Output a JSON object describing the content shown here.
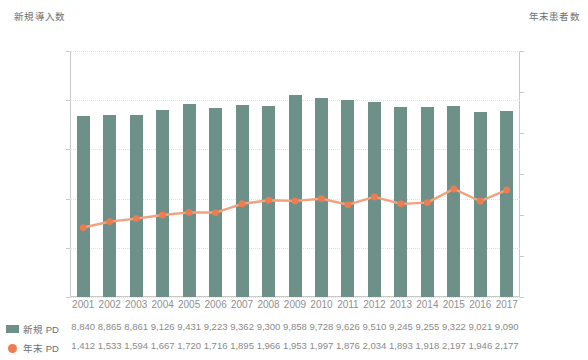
{
  "chart_data": {
    "type": "bar",
    "title": "",
    "subtitle": "",
    "left_axis_title": "新規導入数",
    "right_axis_title": "年末患者数",
    "xlabel": "",
    "categories": [
      "2001",
      "2002",
      "2003",
      "2004",
      "2005",
      "2006",
      "2007",
      "2008",
      "2009",
      "2010",
      "2011",
      "2012",
      "2013",
      "2014",
      "2015",
      "2016",
      "2017"
    ],
    "left_axis": {
      "ticks": [
        "0",
        "1,000",
        "2,000",
        "3,000",
        "4,000",
        "5,000"
      ],
      "values": [
        0,
        1000,
        2000,
        3000,
        4000,
        5000
      ],
      "min": 0,
      "max": 5000
    },
    "right_axis": {
      "ticks": [
        "0",
        "2,000",
        "4,000",
        "6,000",
        "8,000",
        "10,000",
        "12,000"
      ],
      "values": [
        0,
        2000,
        4000,
        6000,
        8000,
        10000,
        12000
      ],
      "min": 0,
      "max": 12000
    },
    "grid": true,
    "legend_position": "bottom-table",
    "series": [
      {
        "name": "新規 PD",
        "render": "bar",
        "axis": "right",
        "color": "#6d9189",
        "values": [
          8840,
          8865,
          8861,
          9126,
          9431,
          9223,
          9362,
          9300,
          9858,
          9728,
          9626,
          9510,
          9245,
          9255,
          9322,
          9021,
          9090
        ],
        "labels": [
          "8,840",
          "8,865",
          "8,861",
          "9,126",
          "9,431",
          "9,223",
          "9,362",
          "9,300",
          "9,858",
          "9,728",
          "9,626",
          "9,510",
          "9,245",
          "9,255",
          "9,322",
          "9,021",
          "9,090"
        ]
      },
      {
        "name": "年末 PD",
        "render": "line",
        "axis": "left",
        "color": "#ef7b50",
        "line_color": "#f4a07c",
        "values": [
          1412,
          1533,
          1594,
          1667,
          1720,
          1716,
          1895,
          1966,
          1953,
          1997,
          1876,
          2034,
          1893,
          1918,
          2197,
          1946,
          2177
        ],
        "labels": [
          "1,412",
          "1,533",
          "1,594",
          "1,667",
          "1,720",
          "1,716",
          "1,895",
          "1,966",
          "1,953",
          "1,997",
          "1,876",
          "2,034",
          "1,893",
          "1,918",
          "2,197",
          "1,946",
          "2,177"
        ]
      }
    ]
  },
  "colors": {
    "bar": "#6d9189",
    "marker": "#ef7b50",
    "line": "#f4a07c",
    "axis": "#c9c9c9",
    "grid": "#e2e2e2",
    "text": "#8a8a8a"
  }
}
